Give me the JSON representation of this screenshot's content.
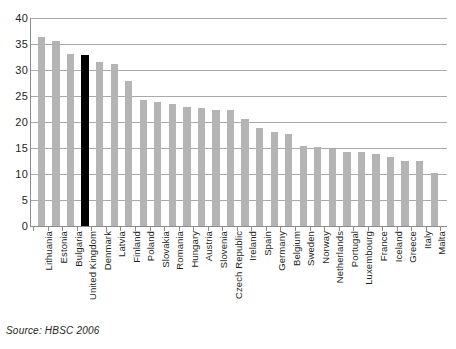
{
  "chart_data": {
    "type": "bar",
    "title": "",
    "subtitle": "",
    "xlabel": "",
    "ylabel": "",
    "ylim": [
      0,
      40
    ],
    "yticks": [
      0,
      5,
      10,
      15,
      20,
      25,
      30,
      35,
      40
    ],
    "grid": true,
    "legend": null,
    "highlight_category": "United Kingdom",
    "highlight_color": "#000000",
    "bar_color": "#b4b4b4",
    "categories": [
      "Lithuania",
      "Estonia",
      "Bulgaria",
      "United Kingdom",
      "Denmark",
      "Latvia",
      "Finland",
      "Poland",
      "Slovakia",
      "Romania",
      "Hungary",
      "Austria",
      "Slovenia",
      "Czech Republic",
      "Ireland",
      "Spain",
      "Germany",
      "Belgium",
      "Sweden",
      "Norway",
      "Netherlands",
      "Portugal",
      "Luxembourg",
      "France",
      "Iceland",
      "Greece",
      "Italy",
      "Malta"
    ],
    "values": [
      36.3,
      35.6,
      33.0,
      32.9,
      31.5,
      31.1,
      27.9,
      24.2,
      23.9,
      23.4,
      22.9,
      22.6,
      22.4,
      22.4,
      20.5,
      18.8,
      18.1,
      17.6,
      15.4,
      15.2,
      14.9,
      14.3,
      14.2,
      13.8,
      13.3,
      12.5,
      12.5,
      10.2
    ]
  },
  "source": {
    "text": "Source: HBSC 2006"
  }
}
